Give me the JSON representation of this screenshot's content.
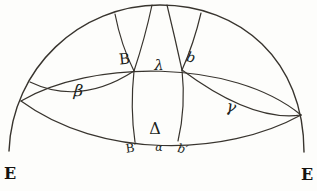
{
  "figure": {
    "labels": {
      "top_left_point": "B",
      "apex_point": "λ",
      "top_right_point": "b",
      "left_lens_region": "β",
      "right_lens_region": "γ",
      "center_region": "Δ",
      "bottom_left_point": "B′",
      "bottom_center_point": "α",
      "bottom_right_point": "b′",
      "left_end_point": "E",
      "right_end_point": "E"
    },
    "colors": {
      "ink": "#38342e",
      "label_ink": "#211f1b",
      "paper": "#fdfdfb"
    }
  }
}
